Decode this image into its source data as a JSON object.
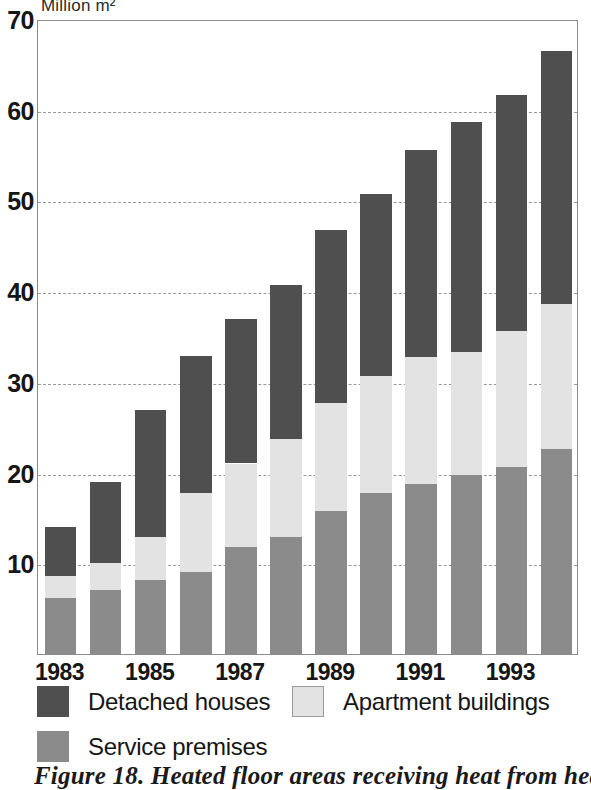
{
  "chart_data": {
    "type": "bar",
    "subtype": "stacked-vertical",
    "title": "",
    "xlabel": "",
    "ylabel": "Million m²",
    "ylim": [
      0,
      70
    ],
    "yticks": [
      10,
      20,
      30,
      40,
      50,
      60,
      70
    ],
    "grid": "horizontal-dashed",
    "legend_position": "below-axis",
    "categories": [
      "1983",
      "1984",
      "1985",
      "1986",
      "1987",
      "1988",
      "1989",
      "1990",
      "1991",
      "1992",
      "1993",
      "1994"
    ],
    "tick_labels_shown": [
      "1983",
      "1985",
      "1987",
      "1989",
      "1991",
      "1993"
    ],
    "series": [
      {
        "name": "Service premises",
        "color": "#8b8b8b",
        "values": [
          6.2,
          7.1,
          8.2,
          9.0,
          11.8,
          12.9,
          15.8,
          17.7,
          18.7,
          19.7,
          20.6,
          22.6
        ]
      },
      {
        "name": "Apartment buildings",
        "color": "#e3e3e3",
        "values": [
          2.4,
          2.9,
          4.7,
          8.8,
          9.2,
          10.8,
          11.9,
          12.9,
          14.0,
          13.6,
          15.0,
          16.0
        ]
      },
      {
        "name": "Detached houses",
        "color": "#4f4f4f",
        "values": [
          5.4,
          9.0,
          14.0,
          15.1,
          15.9,
          17.0,
          19.0,
          20.1,
          22.9,
          25.4,
          26.0,
          27.9
        ]
      }
    ],
    "totals": [
      14.0,
      19.0,
      26.9,
      32.9,
      36.9,
      40.7,
      46.7,
      50.7,
      55.6,
      58.7,
      61.6,
      66.5
    ]
  },
  "axis": {
    "unit_label": "Million m²",
    "y_tick_labels": [
      "70",
      "60",
      "50",
      "40",
      "30",
      "20",
      "10"
    ],
    "x_tick_labels": [
      "1983",
      "1985",
      "1987",
      "1989",
      "1991",
      "1993"
    ]
  },
  "legend": {
    "items": [
      {
        "label": "Detached houses",
        "swatch": "detached"
      },
      {
        "label": "Apartment buildings",
        "swatch": "apartment"
      },
      {
        "label": "Service premises",
        "swatch": "service"
      }
    ]
  },
  "caption": {
    "text": "Figure 18. Heated floor areas receiving heat from heat"
  },
  "colors": {
    "detached": "#4f4f4f",
    "apartment": "#e3e3e3",
    "service": "#8b8b8b",
    "grid": "#9a9a9a",
    "frame": "#8c8c8c"
  }
}
